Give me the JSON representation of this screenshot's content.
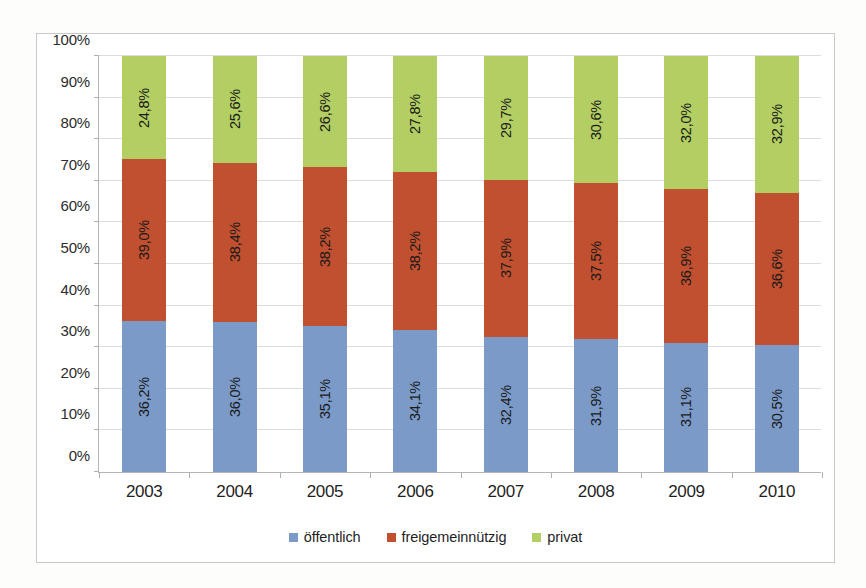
{
  "chart_data": {
    "type": "bar",
    "subtype": "stacked-100-percent",
    "title": "",
    "xlabel": "",
    "ylabel": "",
    "categories": [
      "2003",
      "2004",
      "2005",
      "2006",
      "2007",
      "2008",
      "2009",
      "2010"
    ],
    "ylim": [
      0,
      100
    ],
    "ytick_labels": [
      "0%",
      "10%",
      "20%",
      "30%",
      "40%",
      "50%",
      "60%",
      "70%",
      "80%",
      "90%",
      "100%"
    ],
    "ytick_values": [
      0,
      10,
      20,
      30,
      40,
      50,
      60,
      70,
      80,
      90,
      100
    ],
    "grid": true,
    "grid_axis": "y",
    "legend_position": "bottom",
    "value_label_rotation": -90,
    "decimal_separator": ",",
    "series": [
      {
        "name": "öffentlich",
        "color": "#7b9ac8",
        "values": [
          36.2,
          36.0,
          35.1,
          34.1,
          32.4,
          31.9,
          31.1,
          30.5
        ],
        "labels": [
          "36,2%",
          "36,0%",
          "35,1%",
          "34,1%",
          "32,4%",
          "31,9%",
          "31,1%",
          "30,5%"
        ]
      },
      {
        "name": "freigemeinnützig",
        "color": "#c0502f",
        "values": [
          39.0,
          38.4,
          38.2,
          38.2,
          37.9,
          37.5,
          36.9,
          36.6
        ],
        "labels": [
          "39,0%",
          "38,4%",
          "38,2%",
          "38,2%",
          "37,9%",
          "37,5%",
          "36,9%",
          "36,6%"
        ]
      },
      {
        "name": "privat",
        "color": "#b3ce62",
        "values": [
          24.8,
          25.6,
          26.6,
          27.8,
          29.7,
          30.6,
          32.0,
          32.9
        ],
        "labels": [
          "24,8%",
          "25,6%",
          "26,6%",
          "27,8%",
          "29,7%",
          "30,6%",
          "32,0%",
          "32,9%"
        ]
      }
    ]
  },
  "legend": {
    "items": [
      {
        "label": "öffentlich",
        "color": "#7b9ac8"
      },
      {
        "label": "freigemeinnützig",
        "color": "#c0502f"
      },
      {
        "label": "privat",
        "color": "#b3ce62"
      }
    ]
  }
}
